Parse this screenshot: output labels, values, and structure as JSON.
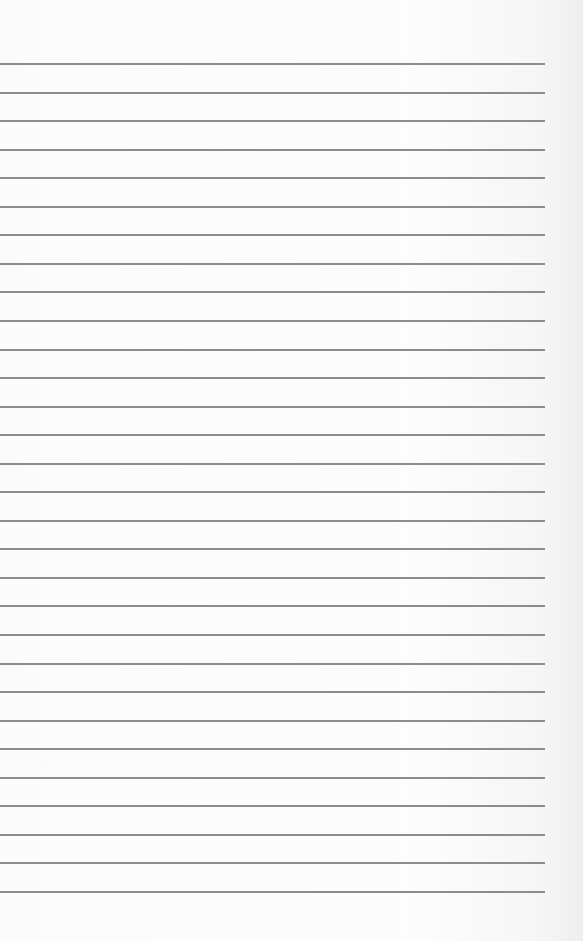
{
  "page": {
    "type": "lined-paper",
    "background_color": "#fbfbfb",
    "line_color": "#8c8c8c",
    "line_count": 30,
    "first_line_y": 63,
    "line_spacing": 28.55,
    "line_width": 545
  }
}
